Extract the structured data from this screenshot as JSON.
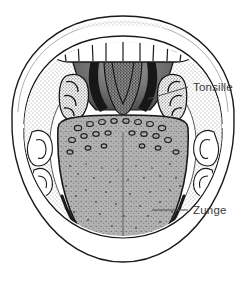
{
  "figure": {
    "background_color": "#ffffff",
    "ink_color": "#1a1a1a",
    "tongue_fill": "#b0b0b0",
    "label_color": "#3a3a3a",
    "width": 246,
    "height": 284
  },
  "labels": [
    {
      "id": "tonsille",
      "text": "Tonsille",
      "text_x": 193,
      "text_y": 91,
      "leader_from_x": 188,
      "leader_from_y": 87,
      "leader_to_x": 148,
      "leader_to_y": 99
    },
    {
      "id": "zunge",
      "text": "Zunge",
      "text_x": 193,
      "text_y": 214,
      "leader_from_x": 188,
      "leader_from_y": 210,
      "leader_to_x": 152,
      "leader_to_y": 210
    }
  ],
  "structures": {
    "upper_lip": "upper-lip",
    "upper_teeth": "upper-teeth-row",
    "upper_teeth_count": 10,
    "soft_palate": "soft-palate",
    "uvula": "uvula",
    "left_tonsil": "left-tonsil",
    "right_tonsil": "right-tonsil",
    "tongue": "tongue-body",
    "median_sulcus": "median-sulcus",
    "circumvallate_papillae": "circumvallate-papillae",
    "lower_teeth_left": "lower-teeth-left",
    "lower_teeth_right": "lower-teeth-right",
    "cheek_left": "inner-cheek-left",
    "cheek_right": "inner-cheek-right"
  }
}
